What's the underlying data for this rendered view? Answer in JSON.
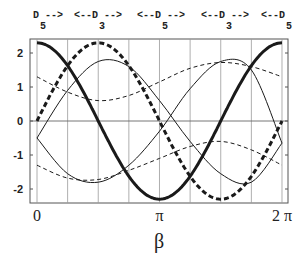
{
  "chart_data": {
    "type": "line",
    "title": "",
    "xlabel": "β",
    "ylabel": "",
    "xlim": [
      0,
      6.2832
    ],
    "ylim": [
      -2.4,
      2.4
    ],
    "grid": {
      "vertical": true,
      "vertical_count": 9,
      "horizontal_zero_line": true
    },
    "x_ticks": [
      {
        "value": 0,
        "label": "0"
      },
      {
        "value": 3.1416,
        "label": "π"
      },
      {
        "value": 6.2832,
        "label": "2 π"
      }
    ],
    "y_ticks": [
      {
        "value": 2,
        "label": "2"
      },
      {
        "value": 1,
        "label": "1"
      },
      {
        "value": 0,
        "label": "0"
      },
      {
        "value": -1,
        "label": "-1"
      },
      {
        "value": -2,
        "label": "-2"
      }
    ],
    "top_annotation": [
      {
        "text": "D",
        "sub": "5",
        "arrow": "-->"
      },
      {
        "text": "<--D",
        "sub": "3",
        "arrow": "-->"
      },
      {
        "text": "<--D",
        "sub": "5",
        "arrow": "-->"
      },
      {
        "text": "<--D",
        "sub": "3",
        "arrow": "-->"
      },
      {
        "text": "<--D",
        "sub": "5",
        "arrow": ""
      }
    ],
    "x_fraction_of_pi": [
      0,
      0.25,
      0.5,
      0.75,
      1.0,
      1.25,
      1.5,
      1.75,
      2.0
    ],
    "series": [
      {
        "name": "thick-solid",
        "style": "solid",
        "width": 3,
        "values": [
          2.3,
          1.63,
          0.0,
          -1.63,
          -2.3,
          -1.63,
          0.0,
          1.63,
          2.3
        ]
      },
      {
        "name": "thick-dashed",
        "style": "dashed",
        "width": 3,
        "values": [
          0.0,
          1.63,
          2.3,
          1.63,
          0.0,
          -1.63,
          -2.3,
          -1.63,
          0.0
        ]
      },
      {
        "name": "thin-solid-a",
        "style": "solid",
        "width": 1,
        "values": [
          -0.5,
          0.9,
          1.75,
          1.6,
          0.6,
          -0.6,
          -1.55,
          -1.8,
          -0.65
        ]
      },
      {
        "name": "thin-solid-b",
        "style": "solid",
        "width": 1,
        "values": [
          -0.5,
          -1.55,
          -1.8,
          -1.3,
          -0.3,
          0.95,
          1.75,
          1.5,
          -0.65
        ]
      },
      {
        "name": "thin-dashed-a",
        "style": "dashed",
        "width": 1,
        "values": [
          1.3,
          0.85,
          0.6,
          0.75,
          1.15,
          1.55,
          1.72,
          1.6,
          1.3
        ]
      },
      {
        "name": "thin-dashed-b",
        "style": "dashed",
        "width": 1,
        "values": [
          -1.3,
          -1.68,
          -1.72,
          -1.45,
          -1.1,
          -0.75,
          -0.6,
          -0.85,
          -1.3
        ]
      }
    ],
    "colors": {
      "line": "#1a1a1a",
      "grid": "#9a9a9a",
      "frame": "#555555",
      "background": "#ffffff"
    }
  }
}
